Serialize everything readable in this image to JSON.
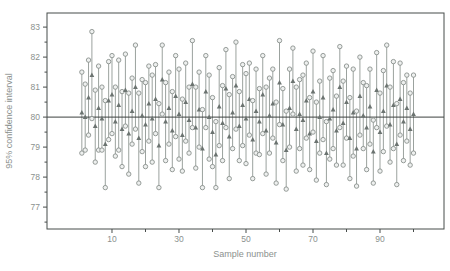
{
  "chart_data": {
    "type": "scatter",
    "subtype": "confidence-interval-plot",
    "title": "",
    "xlabel": "Sample number",
    "ylabel": "95% confidence interval",
    "xlim": [
      -9.4,
      109.1
    ],
    "ylim": [
      76.27,
      83.47
    ],
    "x_ticks_major": [
      10,
      30,
      50,
      70,
      90
    ],
    "x_ticks_minor": [
      20,
      40,
      60,
      80,
      100
    ],
    "y_ticks_major": [
      77,
      78,
      79,
      80,
      81,
      82,
      83
    ],
    "y_ticks_minor": [
      76.5,
      77.5,
      78.5,
      79.5,
      80.5,
      81.5,
      82.5
    ],
    "reference_line_y": 80,
    "grid": false,
    "legend": false,
    "samples": {
      "x": [
        1,
        2,
        3,
        4,
        5,
        6,
        7,
        8,
        9,
        10,
        11,
        12,
        13,
        14,
        15,
        16,
        17,
        18,
        19,
        20,
        21,
        22,
        23,
        24,
        25,
        26,
        27,
        28,
        29,
        30,
        31,
        32,
        33,
        34,
        35,
        36,
        37,
        38,
        39,
        40,
        41,
        42,
        43,
        44,
        45,
        46,
        47,
        48,
        49,
        50,
        51,
        52,
        53,
        54,
        55,
        56,
        57,
        58,
        59,
        60,
        61,
        62,
        63,
        64,
        65,
        66,
        67,
        68,
        69,
        70,
        71,
        72,
        73,
        74,
        75,
        76,
        77,
        78,
        79,
        80,
        81,
        82,
        83,
        84,
        85,
        86,
        87,
        88,
        89,
        90,
        91,
        92,
        93,
        94,
        95,
        96,
        97,
        98,
        99,
        100
      ],
      "lower": [
        78.8,
        78.9,
        79.4,
        79.95,
        78.5,
        78.9,
        78.9,
        77.65,
        79.25,
        79.45,
        78.7,
        78.9,
        78.35,
        79.7,
        78.1,
        79.1,
        79.6,
        77.8,
        78.85,
        78.35,
        79.2,
        78.5,
        79.45,
        77.65,
        80.1,
        78.55,
        79.1,
        78.25,
        79.35,
        78.6,
        78.2,
        79.2,
        78.8,
        79.65,
        78.3,
        79.0,
        77.65,
        79.65,
        78.6,
        78.35,
        77.65,
        79.05,
        78.55,
        79.65,
        77.95,
        78.95,
        79.6,
        78.55,
        79.05,
        78.45,
        79.4,
        77.95,
        78.8,
        78.75,
        79.45,
        78.1,
        78.8,
        79.3,
        77.8,
        79.75,
        78.55,
        77.6,
        79.0,
        80.1,
        78.2,
        78.95,
        78.4,
        79.3,
        78.25,
        79.5,
        77.9,
        78.8,
        79.25,
        77.75,
        78.6,
        78.95,
        78.4,
        79.65,
        78.4,
        79.3,
        77.95,
        78.7,
        77.7,
        79.4,
        78.95,
        78.25,
        79.1,
        77.8,
        79.65,
        78.2,
        78.85,
        79.7,
        78.5,
        78.95,
        77.75,
        79.4,
        78.55,
        79.2,
        78.4,
        78.8
      ],
      "upper": [
        81.5,
        81.1,
        81.9,
        82.85,
        80.9,
        81.7,
        81.0,
        80.55,
        81.85,
        82.05,
        81.0,
        81.9,
        80.85,
        82.1,
        80.8,
        81.3,
        82.4,
        80.8,
        81.25,
        81.15,
        81.7,
        81.4,
        81.75,
        80.45,
        82.4,
        81.15,
        81.5,
        80.85,
        82.05,
        81.6,
        80.6,
        81.8,
        81.0,
        82.55,
        81.0,
        81.5,
        80.25,
        82.05,
        81.4,
        80.65,
        79.85,
        81.65,
        81.05,
        82.25,
        80.75,
        81.35,
        82.5,
        80.85,
        81.75,
        81.45,
        81.8,
        80.55,
        81.6,
        80.95,
        82.05,
        81.0,
        81.3,
        81.6,
        80.5,
        82.55,
        80.95,
        80.2,
        81.6,
        82.3,
        81.0,
        81.25,
        81.4,
        81.8,
        80.65,
        82.2,
        80.5,
        81.2,
        82.05,
        79.85,
        81.3,
        81.55,
        80.7,
        82.35,
        81.2,
        81.7,
        80.65,
        81.6,
        80.2,
        82.0,
        81.15,
        81.05,
        81.6,
        79.9,
        82.15,
        80.8,
        81.55,
        82.4,
        81.0,
        81.85,
        80.45,
        81.8,
        81.15,
        81.4,
        80.8,
        81.4
      ]
    }
  },
  "colors": {
    "background": "#ffffff",
    "box_stroke": "#474c4a",
    "reference_line": "#3c413f",
    "interval_line": "#9ba29e",
    "circle_stroke": "#8a918d",
    "circle_fill": "#eef0ef",
    "triangle_fill": "#6b7370",
    "tick_text": "#8b918e",
    "axis_title_text": "#8b918e"
  }
}
